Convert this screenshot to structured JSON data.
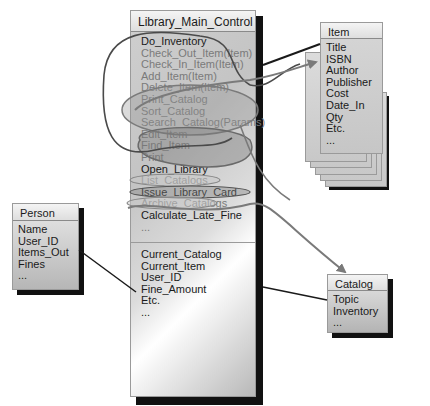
{
  "main_class": {
    "name": "Library_Main_Control",
    "operations": [
      {
        "label": "Do_Inventory",
        "style": "dark"
      },
      {
        "label": "Check_Out_Item(Item)",
        "style": "grey"
      },
      {
        "label": "Check_In_Item(Item)",
        "style": "grey"
      },
      {
        "label": "Add_Item(Item)",
        "style": "grey"
      },
      {
        "label": "Delete_Item(Item)",
        "style": "grey"
      },
      {
        "label": "Print_Catalog",
        "style": "grey"
      },
      {
        "label": "Sort_Catalog",
        "style": "grey"
      },
      {
        "label": "Search_Catalog(Params)",
        "style": "grey"
      },
      {
        "label": "Edit_Item",
        "style": "grey"
      },
      {
        "label": "Find_Item",
        "style": "grey"
      },
      {
        "label": "Print",
        "style": "grey"
      },
      {
        "label": "Open_Library",
        "style": "dark"
      },
      {
        "label": "List_Catalogs",
        "style": "grey"
      },
      {
        "label": "Issue_Library_Card",
        "style": "dark"
      },
      {
        "label": "Archive_Catalogs",
        "style": "grey"
      },
      {
        "label": "Calculate_Late_Fine",
        "style": "dark"
      },
      {
        "label": "...",
        "style": "grey"
      }
    ],
    "attributes": [
      "Current_Catalog",
      "Current_Item",
      "User_ID",
      "Fine_Amount",
      "Etc.",
      "..."
    ]
  },
  "item_class": {
    "name": "Item",
    "attributes": [
      "Title",
      "ISBN",
      "Author",
      "Publisher",
      "Cost",
      "Date_In",
      "Qty",
      "Etc.",
      "..."
    ],
    "stack_count": 5
  },
  "person_class": {
    "name": "Person",
    "attributes": [
      "Name",
      "User_ID",
      "Items_Out",
      "Fines",
      "..."
    ]
  },
  "catalog_class": {
    "name": "Catalog",
    "attributes": [
      "Topic",
      "Inventory",
      "..."
    ]
  },
  "colors": {
    "connector": "#1a1a1a",
    "curve_dark": "#555555",
    "curve_light": "#8a8a8a",
    "arrow": "#7a7a7a"
  }
}
